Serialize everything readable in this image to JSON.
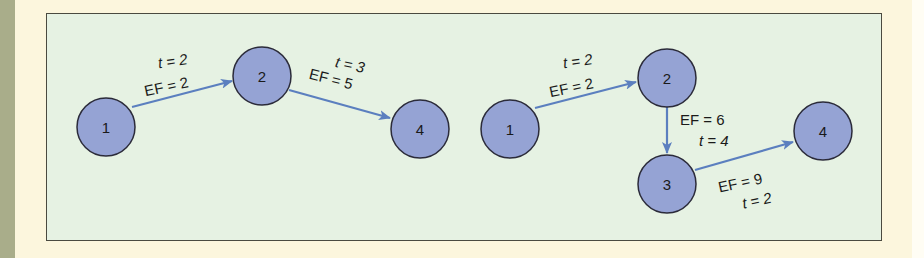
{
  "colors": {
    "background": "#fcf6dd",
    "panel": "#e6f2e3",
    "node_fill": "#95a3d4",
    "node_stroke": "#2b2b3a",
    "edge": "#5b7fbf",
    "strip": "#a9ad8a"
  },
  "left_network": {
    "nodes": [
      {
        "id": "1",
        "label": "1"
      },
      {
        "id": "2",
        "label": "2"
      },
      {
        "id": "4",
        "label": "4"
      }
    ],
    "edges": [
      {
        "from": "1",
        "to": "2",
        "t_label": "t = 2",
        "ef_label": "EF = 2"
      },
      {
        "from": "2",
        "to": "4",
        "t_label": "t = 3",
        "ef_label": "EF = 5"
      }
    ]
  },
  "right_network": {
    "nodes": [
      {
        "id": "1",
        "label": "1"
      },
      {
        "id": "2",
        "label": "2"
      },
      {
        "id": "3",
        "label": "3"
      },
      {
        "id": "4",
        "label": "4"
      }
    ],
    "edges": [
      {
        "from": "1",
        "to": "2",
        "t_label": "t = 2",
        "ef_label": "EF = 2"
      },
      {
        "from": "2",
        "to": "3",
        "t_label": "t = 4",
        "ef_label": "EF = 6"
      },
      {
        "from": "3",
        "to": "4",
        "t_label": "t = 2",
        "ef_label": "EF = 9"
      }
    ]
  }
}
